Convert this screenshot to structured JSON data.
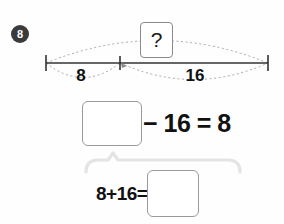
{
  "problem": {
    "number": "8"
  },
  "number_line": {
    "question_mark": "?",
    "left_segment_label": "8",
    "right_segment_label": "16",
    "total_arc_label": "?",
    "left_tick_x": 46,
    "middle_tick_x": 120,
    "right_tick_x": 268,
    "axis_y": 63
  },
  "equation_top": {
    "blank_value": "",
    "expression": "− 16 = 8"
  },
  "equation_bottom": {
    "expression": "8+16=",
    "blank_value": ""
  },
  "colors": {
    "badge_bg": "#3b3b3b",
    "badge_text": "#ffffff",
    "line": "#333333",
    "dotted_arc": "#9a9a9a",
    "box_border": "#9a9a9a",
    "bracket": "#e2e2e2",
    "text": "#111111",
    "background": "#fefefe"
  }
}
